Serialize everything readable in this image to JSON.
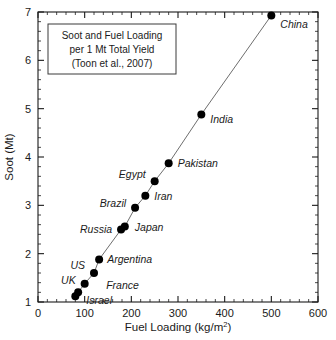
{
  "chart_data": {
    "type": "scatter",
    "title": "",
    "xlabel": "Fuel Loading (kg/m2)",
    "xlabel_main": "Fuel Loading (kg/m",
    "xlabel_sup": "2",
    "xlabel_tail": ")",
    "ylabel": "Soot (Mt)",
    "xlim": [
      0,
      600
    ],
    "ylim": [
      1,
      7
    ],
    "xticks": [
      0,
      100,
      200,
      300,
      400,
      500,
      600
    ],
    "yticks": [
      1,
      2,
      3,
      4,
      5,
      6,
      7
    ],
    "xtick_labels": [
      "0",
      "100",
      "200",
      "300",
      "400",
      "500",
      "600"
    ],
    "ytick_labels": [
      "1",
      "2",
      "3",
      "4",
      "5",
      "6",
      "7"
    ],
    "x_minor_interval": 20,
    "y_minor_interval": 0.2,
    "grid": false,
    "legend": false,
    "connected": true,
    "line_color": "#6e6e6e",
    "marker_color": "#000000",
    "points": [
      {
        "name": "Israel",
        "x": 80,
        "y": 1.12,
        "label_dx": 11,
        "label_dy": 8,
        "label_anchor": "start"
      },
      {
        "name": "France",
        "x": 86,
        "y": 1.2,
        "label_dx": 28,
        "label_dy": -3,
        "label_anchor": "start"
      },
      {
        "name": "UK",
        "x": 100,
        "y": 1.38,
        "label_dx": -9,
        "label_dy": 0,
        "label_anchor": "end"
      },
      {
        "name": "US",
        "x": 120,
        "y": 1.6,
        "label_dx": -9,
        "label_dy": -4,
        "label_anchor": "end"
      },
      {
        "name": "Argentina",
        "x": 131,
        "y": 1.88,
        "label_dx": 8,
        "label_dy": 4,
        "label_anchor": "start"
      },
      {
        "name": "Russia",
        "x": 178,
        "y": 2.5,
        "label_dx": -9,
        "label_dy": 3,
        "label_anchor": "end"
      },
      {
        "name": "Japan",
        "x": 186,
        "y": 2.56,
        "label_dx": 10,
        "label_dy": 4,
        "label_anchor": "start"
      },
      {
        "name": "Brazil",
        "x": 208,
        "y": 2.95,
        "label_dx": -9,
        "label_dy": -1,
        "label_anchor": "end"
      },
      {
        "name": "Iran",
        "x": 230,
        "y": 3.2,
        "label_dx": 9,
        "label_dy": 4,
        "label_anchor": "start"
      },
      {
        "name": "Egypt",
        "x": 250,
        "y": 3.5,
        "label_dx": -9,
        "label_dy": -3,
        "label_anchor": "end"
      },
      {
        "name": "Pakistan",
        "x": 280,
        "y": 3.87,
        "label_dx": 9,
        "label_dy": 4,
        "label_anchor": "start"
      },
      {
        "name": "India",
        "x": 350,
        "y": 4.88,
        "label_dx": 9,
        "label_dy": 9,
        "label_anchor": "start"
      },
      {
        "name": "China",
        "x": 500,
        "y": 6.93,
        "label_dx": 9,
        "label_dy": 13,
        "label_anchor": "start"
      }
    ]
  },
  "annotation": {
    "line1": "Soot and Fuel Loading",
    "line2": "per 1 Mt Total Yield",
    "line3": "(Toon et al., 2007)"
  }
}
